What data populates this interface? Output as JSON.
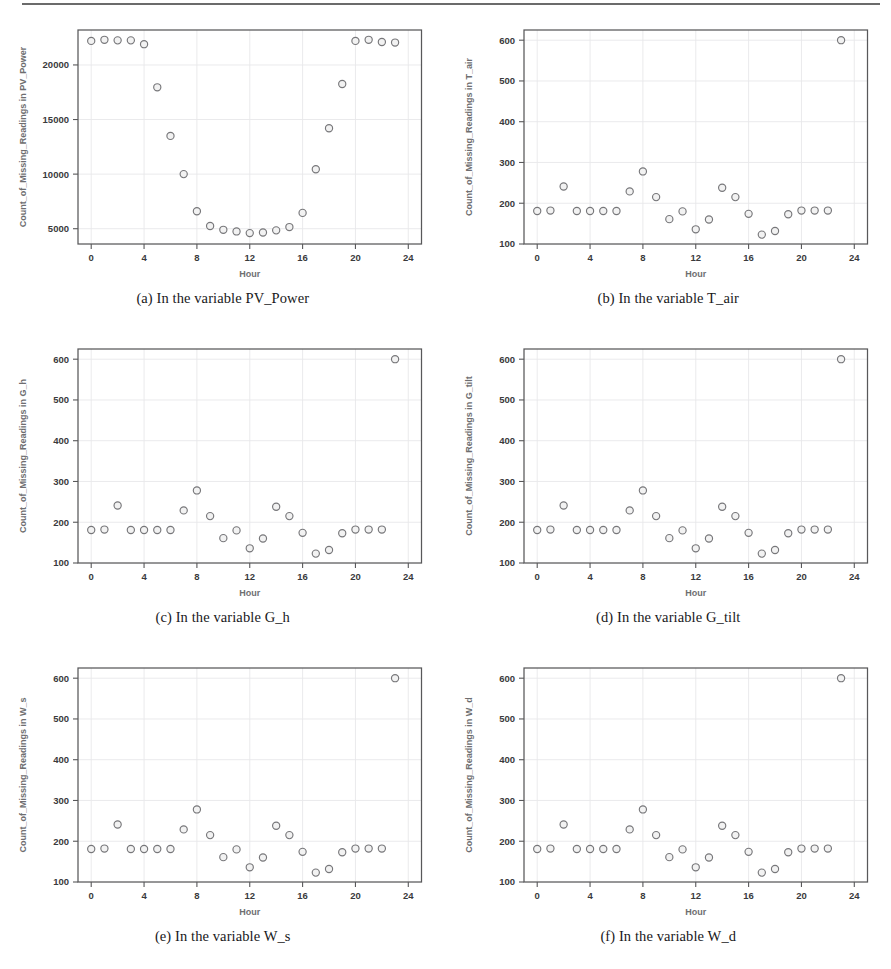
{
  "figure": {
    "x_axis_label": "Hour",
    "marker_stroke_color": "#77777a",
    "marker_fill_color": "#f2f2f2",
    "axis_color": "#58585a",
    "grid_color": "#e8e8ea",
    "label_color": "#6e6e70"
  },
  "panels": [
    {
      "caption": "(a) In the variable PV_Power",
      "y_axis_label": "Count_of_Missing_Readings in PV_Power",
      "chart_data": {
        "type": "scatter",
        "title": "",
        "xlabel": "Hour",
        "ylabel": "Count_of_Missing_Readings in PV_Power",
        "xlim": [
          -1,
          25
        ],
        "ylim": [
          3600,
          23200
        ],
        "xticks": [
          0,
          4,
          8,
          12,
          16,
          20,
          24
        ],
        "yticks": [
          5000,
          10000,
          15000,
          20000
        ],
        "grid": true,
        "legend": "none",
        "x": [
          0,
          1,
          2,
          3,
          4,
          5,
          6,
          7,
          8,
          9,
          10,
          11,
          12,
          13,
          14,
          15,
          16,
          17,
          18,
          19,
          20,
          21,
          22,
          23
        ],
        "y": [
          22200,
          22300,
          22250,
          22250,
          21900,
          17950,
          13500,
          10000,
          6600,
          5250,
          4900,
          4750,
          4600,
          4650,
          4850,
          5150,
          6450,
          10450,
          14200,
          18250,
          22200,
          22300,
          22100,
          22050
        ]
      }
    },
    {
      "caption": "(b) In the variable T_air",
      "y_axis_label": "Count_of_Missing_Readings in T_air",
      "chart_data": {
        "type": "scatter",
        "title": "",
        "xlabel": "Hour",
        "ylabel": "Count_of_Missing_Readings in T_air",
        "xlim": [
          -1,
          25
        ],
        "ylim": [
          100,
          625
        ],
        "xticks": [
          0,
          4,
          8,
          12,
          16,
          20,
          24
        ],
        "yticks": [
          100,
          200,
          300,
          400,
          500,
          600
        ],
        "grid": true,
        "legend": "none",
        "x": [
          0,
          1,
          2,
          3,
          4,
          5,
          6,
          7,
          8,
          9,
          10,
          11,
          12,
          13,
          14,
          15,
          16,
          17,
          18,
          19,
          20,
          21,
          22,
          23
        ],
        "y": [
          181,
          182,
          241,
          181,
          181,
          181,
          181,
          229,
          278,
          215,
          161,
          180,
          136,
          160,
          238,
          215,
          174,
          123,
          132,
          173,
          182,
          182,
          182,
          600
        ]
      }
    },
    {
      "caption": "(c) In the variable G_h",
      "y_axis_label": "Count_of_Missing_Readings in G_h",
      "chart_data": {
        "type": "scatter",
        "title": "",
        "xlabel": "Hour",
        "ylabel": "Count_of_Missing_Readings in G_h",
        "xlim": [
          -1,
          25
        ],
        "ylim": [
          100,
          625
        ],
        "xticks": [
          0,
          4,
          8,
          12,
          16,
          20,
          24
        ],
        "yticks": [
          100,
          200,
          300,
          400,
          500,
          600
        ],
        "grid": true,
        "legend": "none",
        "x": [
          0,
          1,
          2,
          3,
          4,
          5,
          6,
          7,
          8,
          9,
          10,
          11,
          12,
          13,
          14,
          15,
          16,
          17,
          18,
          19,
          20,
          21,
          22,
          23
        ],
        "y": [
          181,
          182,
          241,
          181,
          181,
          181,
          181,
          229,
          278,
          215,
          161,
          180,
          136,
          160,
          238,
          215,
          174,
          123,
          132,
          173,
          182,
          182,
          182,
          600
        ]
      }
    },
    {
      "caption": "(d) In the variable G_tilt",
      "y_axis_label": "Count_of_Missing_Readings in G_tilt",
      "chart_data": {
        "type": "scatter",
        "title": "",
        "xlabel": "Hour",
        "ylabel": "Count_of_Missing_Readings in G_tilt",
        "xlim": [
          -1,
          25
        ],
        "ylim": [
          100,
          625
        ],
        "xticks": [
          0,
          4,
          8,
          12,
          16,
          20,
          24
        ],
        "yticks": [
          100,
          200,
          300,
          400,
          500,
          600
        ],
        "grid": true,
        "legend": "none",
        "x": [
          0,
          1,
          2,
          3,
          4,
          5,
          6,
          7,
          8,
          9,
          10,
          11,
          12,
          13,
          14,
          15,
          16,
          17,
          18,
          19,
          20,
          21,
          22,
          23
        ],
        "y": [
          181,
          182,
          241,
          181,
          181,
          181,
          181,
          229,
          278,
          215,
          161,
          180,
          136,
          160,
          238,
          215,
          174,
          123,
          132,
          173,
          182,
          182,
          182,
          600
        ]
      }
    },
    {
      "caption": "(e) In the variable W_s",
      "y_axis_label": "Count_of_Missing_Readings in W_s",
      "chart_data": {
        "type": "scatter",
        "title": "",
        "xlabel": "Hour",
        "ylabel": "Count_of_Missing_Readings in W_s",
        "xlim": [
          -1,
          25
        ],
        "ylim": [
          100,
          625
        ],
        "xticks": [
          0,
          4,
          8,
          12,
          16,
          20,
          24
        ],
        "yticks": [
          100,
          200,
          300,
          400,
          500,
          600
        ],
        "grid": true,
        "legend": "none",
        "x": [
          0,
          1,
          2,
          3,
          4,
          5,
          6,
          7,
          8,
          9,
          10,
          11,
          12,
          13,
          14,
          15,
          16,
          17,
          18,
          19,
          20,
          21,
          22,
          23
        ],
        "y": [
          181,
          182,
          241,
          181,
          181,
          181,
          181,
          229,
          278,
          215,
          161,
          180,
          136,
          160,
          238,
          215,
          174,
          123,
          132,
          173,
          182,
          182,
          182,
          600
        ]
      }
    },
    {
      "caption": "(f) In the variable W_d",
      "y_axis_label": "Count_of_Missing_Readings in W_d",
      "chart_data": {
        "type": "scatter",
        "title": "",
        "xlabel": "Hour",
        "ylabel": "Count_of_Missing_Readings in W_d",
        "xlim": [
          -1,
          25
        ],
        "ylim": [
          100,
          625
        ],
        "xticks": [
          0,
          4,
          8,
          12,
          16,
          20,
          24
        ],
        "yticks": [
          100,
          200,
          300,
          400,
          500,
          600
        ],
        "grid": true,
        "legend": "none",
        "x": [
          0,
          1,
          2,
          3,
          4,
          5,
          6,
          7,
          8,
          9,
          10,
          11,
          12,
          13,
          14,
          15,
          16,
          17,
          18,
          19,
          20,
          21,
          22,
          23
        ],
        "y": [
          181,
          182,
          241,
          181,
          181,
          181,
          181,
          229,
          278,
          215,
          161,
          180,
          136,
          160,
          238,
          215,
          174,
          123,
          132,
          173,
          182,
          182,
          182,
          600
        ]
      }
    }
  ]
}
